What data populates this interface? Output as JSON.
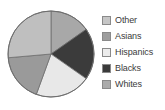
{
  "chart_data": {
    "type": "pie",
    "title": "",
    "categories": [
      "Other",
      "Asians",
      "Hispanics",
      "Blacks",
      "Whites"
    ],
    "values": [
      19,
      21,
      19,
      15,
      26
    ],
    "legend_position": "right",
    "grid": false,
    "slice_colors": [
      "#bfbfbf",
      "#9a9a9a",
      "#e8e8e8",
      "#3b3b3b",
      "#a8a8a8"
    ],
    "slices": [
      {
        "label": "Other",
        "value": 19,
        "color": "#bfbfbf",
        "start_angle": 265,
        "end_angle": 360
      },
      {
        "label": "Asians",
        "value": 21,
        "color": "#9a9a9a",
        "start_angle": 200,
        "end_angle": 265
      },
      {
        "label": "Hispanics",
        "value": 19,
        "color": "#e8e8e8",
        "start_angle": 125,
        "end_angle": 200
      },
      {
        "label": "Blacks",
        "value": 15,
        "color": "#3b3b3b",
        "start_angle": 55,
        "end_angle": 125
      },
      {
        "label": "Whites",
        "value": 26,
        "color": "#a8a8a8",
        "start_angle": 0,
        "end_angle": 55
      }
    ]
  },
  "legend": {
    "items": [
      {
        "label": "Other",
        "swatch_color": "#c6c6c6"
      },
      {
        "label": "Asians",
        "swatch_color": "#9e9e9e"
      },
      {
        "label": "Hispanics",
        "swatch_color": "#ececec"
      },
      {
        "label": "Blacks",
        "swatch_color": "#3a3a3a"
      },
      {
        "label": "Whites",
        "swatch_color": "#ababab"
      }
    ]
  }
}
